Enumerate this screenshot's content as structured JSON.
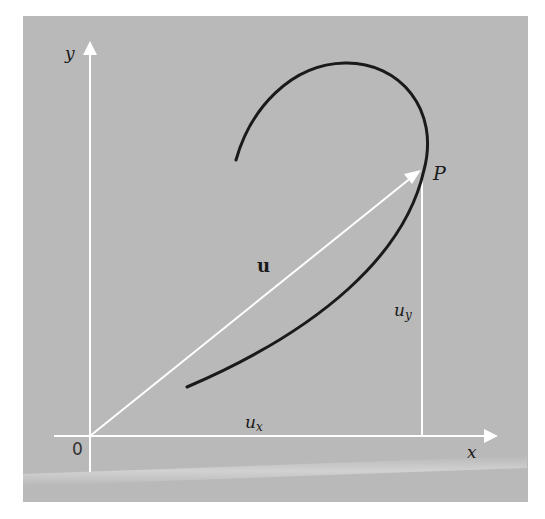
{
  "diagram": {
    "type": "vector-position-on-curve",
    "labels": {
      "y_axis": "y",
      "x_axis": "x",
      "origin": "0",
      "point": "P",
      "vector": "u",
      "ux_base": "u",
      "ux_sub": "x",
      "uy_base": "u",
      "uy_sub": "y"
    },
    "colors": {
      "background": "#b9b9b9",
      "axes": "#ffffff",
      "curve": "#1a1a1a",
      "vector": "#ffffff",
      "text": "#1a1a1a"
    }
  }
}
